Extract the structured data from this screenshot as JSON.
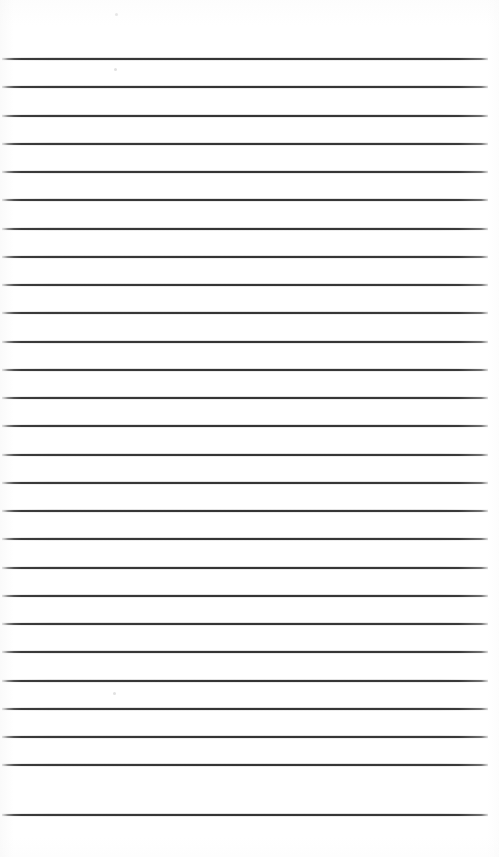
{
  "document": {
    "kind": "scanned-lined-paper",
    "title": "Blank lined notebook page",
    "page_width": 499,
    "page_height": 857,
    "background_color": "#ffffff",
    "content_text": "",
    "has_handwriting": false,
    "has_printed_text": false
  },
  "ruling": {
    "line_color": "#343434",
    "line_thickness_px": 2,
    "line_count": 27,
    "line_spacing_px": 28.3,
    "first_line_y": 58,
    "left_margin_x": 2,
    "right_end_x": 488,
    "line_length_px": 486,
    "bottom_blank_space_px": 43,
    "top_blank_space_px": 58,
    "lines_y": [
      58,
      86,
      115,
      143,
      171,
      199,
      228,
      256,
      284,
      312,
      341,
      369,
      397,
      425,
      454,
      482,
      510,
      538,
      567,
      595,
      623,
      651,
      680,
      708,
      736,
      764,
      814
    ]
  },
  "artifacts": {
    "specks": [
      {
        "x": 115,
        "y": 13,
        "size": 3
      },
      {
        "x": 114,
        "y": 68,
        "size": 3
      },
      {
        "x": 113,
        "y": 692,
        "size": 3
      }
    ]
  }
}
